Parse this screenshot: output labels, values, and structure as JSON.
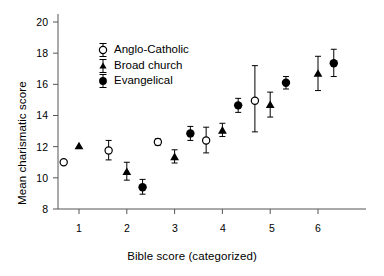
{
  "chart_data": {
    "type": "scatter",
    "title": "",
    "xlabel": "Bible score (categorized)",
    "ylabel": "Mean charismatic score",
    "xlim": [
      0.45,
      6.55
    ],
    "ylim": [
      7.4,
      20.6
    ],
    "yticks": [
      8,
      10,
      12,
      14,
      16,
      18,
      20
    ],
    "xticks": [
      1,
      2,
      3,
      4,
      5,
      6
    ],
    "grid": false,
    "legend_position": "upper-left-inside",
    "series": [
      {
        "name": "Anglo-Catholic",
        "marker": "open-circle",
        "color": "#000000",
        "points": [
          {
            "x": 0.68,
            "y": 11.0,
            "lo": 11.0,
            "hi": 11.0
          },
          {
            "x": 1.62,
            "y": 11.75,
            "lo": 11.15,
            "hi": 12.4
          },
          {
            "x": 2.65,
            "y": 12.3,
            "lo": 12.1,
            "hi": 12.5
          },
          {
            "x": 3.66,
            "y": 12.4,
            "lo": 11.6,
            "hi": 13.25
          },
          {
            "x": 4.68,
            "y": 14.95,
            "lo": 12.95,
            "hi": 17.2
          }
        ]
      },
      {
        "name": "Broad church",
        "marker": "filled-triangle",
        "color": "#000000",
        "points": [
          {
            "x": 1.0,
            "y": 12.05,
            "lo": 12.05,
            "hi": 12.05
          },
          {
            "x": 2.0,
            "y": 10.4,
            "lo": 9.85,
            "hi": 11.0
          },
          {
            "x": 3.0,
            "y": 11.35,
            "lo": 10.95,
            "hi": 11.8
          },
          {
            "x": 4.0,
            "y": 13.05,
            "lo": 12.65,
            "hi": 13.5
          },
          {
            "x": 5.0,
            "y": 14.7,
            "lo": 13.9,
            "hi": 15.5
          },
          {
            "x": 6.0,
            "y": 16.7,
            "lo": 15.6,
            "hi": 17.8
          }
        ]
      },
      {
        "name": "Evangelical",
        "marker": "filled-circle",
        "color": "#000000",
        "points": [
          {
            "x": 2.33,
            "y": 9.4,
            "lo": 8.95,
            "hi": 9.9
          },
          {
            "x": 3.33,
            "y": 12.85,
            "lo": 12.4,
            "hi": 13.3
          },
          {
            "x": 4.33,
            "y": 14.65,
            "lo": 14.2,
            "hi": 15.1
          },
          {
            "x": 5.33,
            "y": 16.1,
            "lo": 15.7,
            "hi": 16.5
          },
          {
            "x": 6.33,
            "y": 17.35,
            "lo": 16.5,
            "hi": 18.25
          }
        ]
      }
    ]
  },
  "legend": {
    "items": [
      {
        "label": "Anglo-Catholic",
        "marker": "open-circle"
      },
      {
        "label": "Broad church",
        "marker": "filled-triangle"
      },
      {
        "label": "Evangelical",
        "marker": "filled-circle"
      }
    ]
  },
  "axes": {
    "x_title": "Bible score (categorized)",
    "y_title": "Mean charismatic score",
    "y_tick_labels": [
      "20",
      "18",
      "16",
      "14",
      "12",
      "10",
      "8"
    ],
    "x_tick_labels": [
      "1",
      "2",
      "3",
      "4",
      "5",
      "6"
    ]
  },
  "style": {
    "axis_color": "#555555",
    "marker_color": "#000000",
    "background": "#ffffff"
  }
}
